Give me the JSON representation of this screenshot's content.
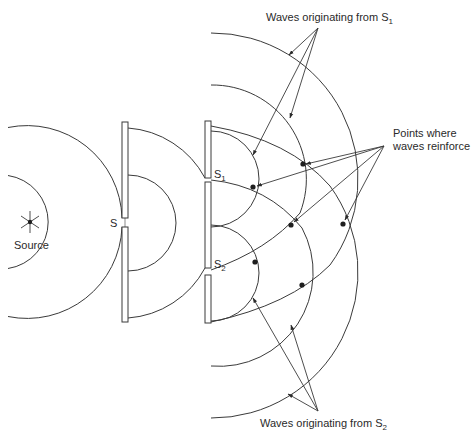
{
  "diagram": {
    "labels": {
      "source": "Source",
      "slit_s": "S",
      "slit_s1": "S",
      "slit_s1_sub": "1",
      "slit_s2": "S",
      "slit_s2_sub": "2",
      "waves_s1": "Waves originating from S",
      "waves_s1_sub": "1",
      "points_line1": "Points where",
      "points_line2": "waves reinforce",
      "waves_s2": "Waves originating from S",
      "waves_s2_sub": "2"
    },
    "elements": {
      "source": "point light source",
      "barrier_1": "screen with single slit S",
      "barrier_2": "screen with double slits S1 and S2",
      "reinforcement_points_count": 6
    },
    "colors": {
      "line": "#3a3a3a",
      "dot": "#1e1e1e",
      "background": "#ffffff"
    }
  }
}
